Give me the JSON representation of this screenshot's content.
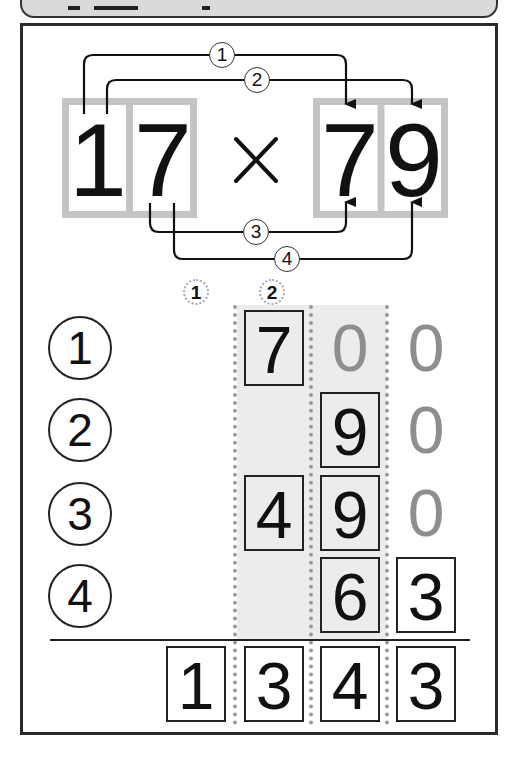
{
  "header": {
    "title_fragment": "【例題】",
    "background": "#d9d9d9"
  },
  "problem": {
    "multiplicand_digits": [
      "1",
      "7"
    ],
    "operator": "×",
    "multiplier_digits": [
      "7",
      "9"
    ],
    "expression": "17 × 79"
  },
  "arrows": [
    {
      "label": "1",
      "from": "1 (tens of 17)",
      "to": "7 (tens of 79)"
    },
    {
      "label": "2",
      "from": "1 (tens of 17)",
      "to": "9 (ones of 79)"
    },
    {
      "label": "3",
      "from": "7 (ones of 17)",
      "to": "7 (tens of 79)"
    },
    {
      "label": "4",
      "from": "7 (ones of 17)",
      "to": "9 (ones of 79)"
    }
  ],
  "column_markers": [
    "1",
    "2"
  ],
  "rows": [
    {
      "label": "1",
      "cells": [
        "",
        "7",
        "0",
        "0"
      ],
      "boxed": [
        false,
        true,
        false,
        false
      ],
      "ghost": [
        false,
        false,
        true,
        true
      ]
    },
    {
      "label": "2",
      "cells": [
        "",
        "",
        "9",
        "0"
      ],
      "boxed": [
        false,
        false,
        true,
        false
      ],
      "ghost": [
        false,
        false,
        false,
        true
      ]
    },
    {
      "label": "3",
      "cells": [
        "",
        "4",
        "9",
        "0"
      ],
      "boxed": [
        false,
        true,
        true,
        false
      ],
      "ghost": [
        false,
        false,
        false,
        true
      ]
    },
    {
      "label": "4",
      "cells": [
        "",
        "",
        "6",
        "3"
      ],
      "boxed": [
        false,
        false,
        true,
        true
      ],
      "ghost": [
        false,
        false,
        false,
        false
      ]
    }
  ],
  "result": {
    "digits": [
      "1",
      "3",
      "4",
      "3"
    ],
    "value": "1343"
  },
  "colors": {
    "ink": "#111111",
    "ghost_digit": "#8e8e8e",
    "digit_frame_gray": "#c4c4c4",
    "column_shade": "#ececec",
    "dotted_guide": "#9a9a9a"
  }
}
